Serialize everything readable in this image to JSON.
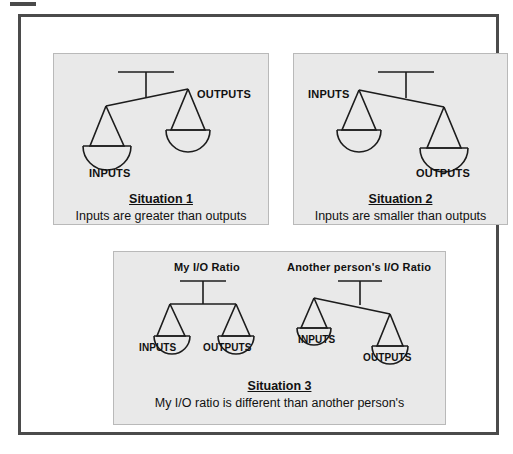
{
  "figure": {
    "background_color": "#ffffff",
    "frame_color": "#4b4b4b",
    "panel_background": "#e9e9e9",
    "panel_border": "#b9b9b9",
    "ink_color": "#1c1c1c"
  },
  "panels": [
    {
      "id": "situation-1",
      "title": "Situation 1",
      "description": "Inputs are greater than outputs",
      "scales": [
        {
          "id": "scale-1",
          "tilt": "left-down",
          "left_label": "INPUTS",
          "right_label": "OUTPUTS",
          "heading": ""
        }
      ]
    },
    {
      "id": "situation-2",
      "title": "Situation 2",
      "description": "Inputs are smaller than outputs",
      "scales": [
        {
          "id": "scale-2",
          "tilt": "right-down",
          "left_label": "INPUTS",
          "right_label": "OUTPUTS",
          "heading": ""
        }
      ]
    },
    {
      "id": "situation-3",
      "title": "Situation 3",
      "description": "My I/O ratio is different than another person's",
      "scales": [
        {
          "id": "scale-3a",
          "tilt": "level",
          "left_label": "INPUTS",
          "right_label": "OUTPUTS",
          "heading": "My I/O Ratio"
        },
        {
          "id": "scale-3b",
          "tilt": "right-down",
          "left_label": "INPUTS",
          "right_label": "OUTPUTS",
          "heading": "Another person's  I/O Ratio"
        }
      ]
    }
  ]
}
